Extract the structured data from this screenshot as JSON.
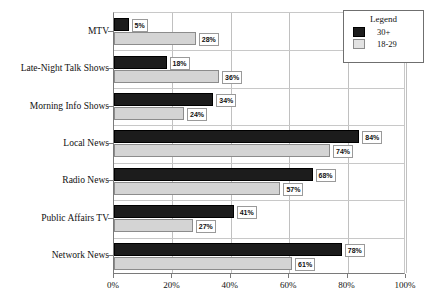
{
  "chart_data": {
    "type": "bar",
    "orientation": "horizontal",
    "title": "",
    "xlabel": "",
    "ylabel": "",
    "xlim": [
      0,
      100
    ],
    "xticks": [
      "0%",
      "20%",
      "40%",
      "60%",
      "80%",
      "100%"
    ],
    "xtick_values": [
      0,
      20,
      40,
      60,
      80,
      100
    ],
    "grid": true,
    "grid_axis": "x",
    "categories": [
      "MTV",
      "Late-Night Talk Shows",
      "Morning Info Shows",
      "Local News",
      "Radio News",
      "Public Affairs TV",
      "Network News"
    ],
    "series": [
      {
        "name": "30+",
        "color": "#1c1c1c",
        "values": [
          5,
          18,
          34,
          84,
          68,
          41,
          78
        ],
        "labels": [
          "5%",
          "18%",
          "34%",
          "84%",
          "68%",
          "41%",
          "78%"
        ]
      },
      {
        "name": "18-29",
        "color": "#d4d4d4",
        "values": [
          28,
          36,
          24,
          74,
          57,
          27,
          61
        ],
        "labels": [
          "28%",
          "36%",
          "24%",
          "74%",
          "57%",
          "27%",
          "61%"
        ]
      }
    ],
    "legend": {
      "title": "Legend",
      "position": "top-right",
      "entries": [
        {
          "label": "30+",
          "color": "#1c1c1c"
        },
        {
          "label": "18-29",
          "color": "#e2e2e2"
        }
      ]
    }
  }
}
